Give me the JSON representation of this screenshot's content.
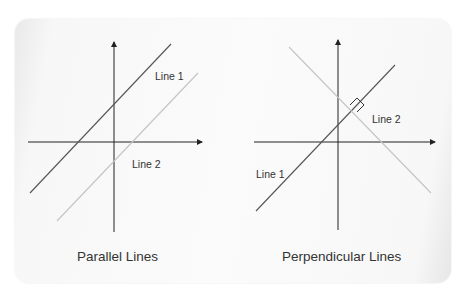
{
  "diagrams": [
    {
      "caption": "Parallel Lines",
      "line1_label": "Line 1",
      "line2_label": "Line 2"
    },
    {
      "caption": "Perpendicular Lines",
      "line1_label": "Line 1",
      "line2_label": "Line 2"
    }
  ],
  "colors": {
    "line_dark": "#555555",
    "line_light": "#c4c4c4",
    "axis": "#222222",
    "text": "#333333"
  }
}
